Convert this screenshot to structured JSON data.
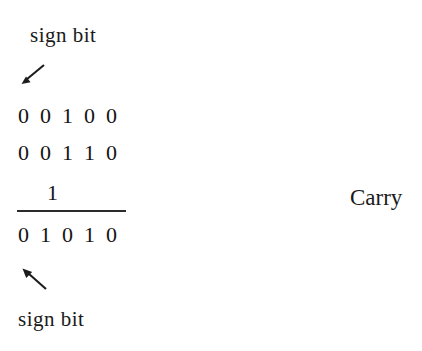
{
  "diagram": {
    "title_top_label": "sign bit",
    "bottom_label": "sign bit",
    "carry_label": "Carry",
    "carry_digit": "1",
    "rows": [
      {
        "name": "addend-1",
        "bits": [
          "0",
          "0",
          "1",
          "0",
          "0"
        ]
      },
      {
        "name": "addend-2",
        "bits": [
          "0",
          "0",
          "1",
          "1",
          "0"
        ]
      },
      {
        "name": "sum",
        "bits": [
          "0",
          "1",
          "0",
          "1",
          "0"
        ]
      }
    ],
    "arrows": {
      "top": "arrow-down-left-icon",
      "bottom": "arrow-up-left-icon"
    },
    "colors": {
      "ink": "#1a1a1a",
      "background": "#ffffff",
      "rule": "#2b2b2b"
    }
  }
}
